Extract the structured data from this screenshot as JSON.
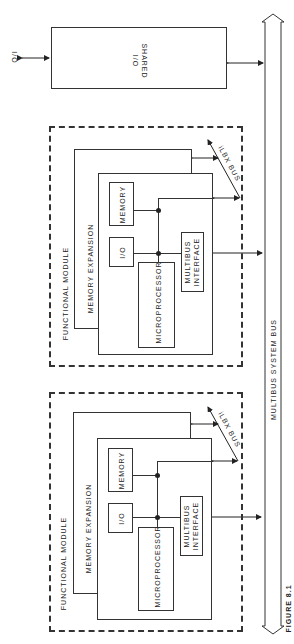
{
  "diagram": {
    "shared_io": {
      "label_line1": "SHARED",
      "label_line2": "I/O",
      "external_label": "I/O"
    },
    "system_bus": {
      "label": "MULTIBUS SYSTEM BUS"
    },
    "modules": [
      {
        "title": "FUNCTIONAL MODULE",
        "memory_expansion": "MEMORY EXPANSION",
        "memory": "MEMORY",
        "io": "I/O",
        "microprocessor": "MICROPROCESSOR",
        "interface_line1": "MULTIBUS",
        "interface_line2": "INTERFACE",
        "local_bus": "iLBX BUS"
      },
      {
        "title": "FUNCTIONAL MODULE",
        "memory_expansion": "MEMORY EXPANSION",
        "memory": "MEMORY",
        "io": "I/O",
        "microprocessor": "MICROPROCESSOR",
        "interface_line1": "MULTIBUS",
        "interface_line2": "INTERFACE",
        "local_bus": "iLBX BUS"
      }
    ],
    "caption": "FIGURE 8.1"
  }
}
